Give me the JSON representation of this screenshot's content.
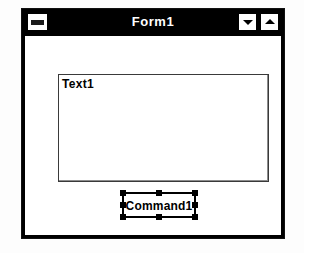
{
  "window": {
    "title": "Form1",
    "control_box": {
      "name": "control-menu-box",
      "icon": "control-menu-icon"
    },
    "minimize": {
      "label": "",
      "icon": "arrow-down-icon"
    },
    "maximize": {
      "label": "",
      "icon": "arrow-up-icon"
    }
  },
  "designer": {
    "grid_visible": true,
    "grid_spacing_px": 8,
    "controls": [
      {
        "type": "TextBox",
        "name": "Text1",
        "text": "Text1",
        "selected": false
      },
      {
        "type": "CommandButton",
        "name": "Command1",
        "caption": "Command1",
        "selected": true,
        "handle_count": 8
      }
    ]
  },
  "colors": {
    "titlebar_bg": "#000000",
    "titlebar_fg": "#ffffff",
    "form_bg": "#ffffff",
    "grid_dot": "#6e6e6e",
    "control_border": "#000000",
    "selection_handle": "#000000",
    "page_bg": "#fdfdfd"
  }
}
